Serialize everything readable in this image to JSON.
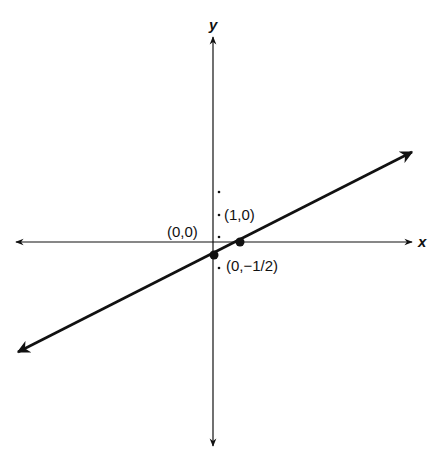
{
  "diagram": {
    "type": "coordinate-plane",
    "colors": {
      "ink": "#111111",
      "background": "#ffffff"
    },
    "axes": {
      "x_label": "x",
      "y_label": "y"
    },
    "points": [
      {
        "label": "(0,0)",
        "role": "origin-label"
      },
      {
        "label": "(1,0)",
        "role": "x-intercept"
      },
      {
        "label": "(0,−1/2)",
        "role": "y-intercept"
      }
    ],
    "line": {
      "description": "straight line through (0,-1/2) and (1,0) with arrows at both ends"
    }
  }
}
